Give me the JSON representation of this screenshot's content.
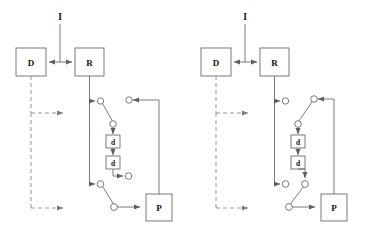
{
  "figure": {
    "type": "diagram",
    "background_color": "#ffffff",
    "line_color": "#6b6b6b",
    "box_stroke_color": "#6b6b6b",
    "text_color": "#111111",
    "dashed_color": "#8a8a8a"
  },
  "panels": [
    {
      "id": "left-panel",
      "name": "panel-left",
      "input": {
        "label": "I"
      },
      "boxes": {
        "d": {
          "label": "D"
        },
        "r": {
          "label": "R"
        },
        "p": {
          "label": "P"
        },
        "delay1": {
          "label": "d"
        },
        "delay2": {
          "label": "d"
        }
      },
      "switch_upper": {
        "state": "left-closed"
      },
      "switch_lower": {
        "state": "left-closed"
      }
    },
    {
      "id": "right-panel",
      "name": "panel-right",
      "input": {
        "label": "I"
      },
      "boxes": {
        "d": {
          "label": "D"
        },
        "r": {
          "label": "R"
        },
        "p": {
          "label": "P"
        },
        "delay1": {
          "label": "d"
        },
        "delay2": {
          "label": "d"
        }
      },
      "switch_upper": {
        "state": "right-closed"
      },
      "switch_lower": {
        "state": "right-closed"
      }
    }
  ]
}
